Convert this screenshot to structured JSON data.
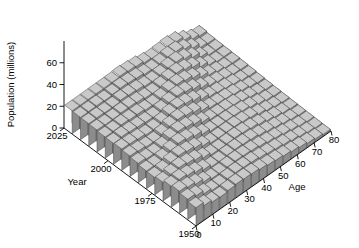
{
  "chart_data": {
    "type": "bar",
    "subtype": "bar3-surface",
    "title": "",
    "xlabel": "Age",
    "ylabel": "Year",
    "zlabel": "Population (millions)",
    "projection": "3d-isometric",
    "grid": false,
    "legend": "none",
    "zlim": [
      0,
      80
    ],
    "z_ticks": [
      "0",
      "20",
      "40",
      "60"
    ],
    "z_tick_values": [
      0,
      20,
      40,
      60
    ],
    "x_ticks": [
      "0",
      "10",
      "20",
      "30",
      "40",
      "50",
      "60",
      "70",
      "80"
    ],
    "x_tick_values": [
      0,
      10,
      20,
      30,
      40,
      50,
      60,
      70,
      80
    ],
    "y_ticks": [
      "2025",
      "2000",
      "1975",
      "1950"
    ],
    "y_tick_values": [
      2025,
      2000,
      1975,
      1950
    ],
    "x_label_text": "Age",
    "y_label_text": "Year",
    "z_label_text": "Population (millions)",
    "age_bins": [
      0,
      5,
      10,
      15,
      20,
      25,
      30,
      35,
      40,
      45,
      50,
      55,
      60,
      65,
      70,
      75,
      80
    ],
    "years": [
      1950,
      1955,
      1960,
      1965,
      1970,
      1975,
      1980,
      1985,
      1990,
      1995,
      2000,
      2005,
      2010,
      2015,
      2020,
      2025
    ],
    "series": [
      {
        "name": "1950",
        "values": [
          16.4,
          13.2,
          11.1,
          10.6,
          11.6,
          12.2,
          11.9,
          11.5,
          10.3,
          9.1,
          8.3,
          7.3,
          6.1,
          4.9,
          3.6,
          2.4,
          1.5
        ]
      },
      {
        "name": "1955",
        "values": [
          18.6,
          16.3,
          13.1,
          11.0,
          10.7,
          11.6,
          12.1,
          11.8,
          11.3,
          10.1,
          8.9,
          7.9,
          6.7,
          5.3,
          3.9,
          2.6,
          1.7
        ]
      },
      {
        "name": "1960",
        "values": [
          20.3,
          18.6,
          16.3,
          13.2,
          11.1,
          10.9,
          11.7,
          12.0,
          11.6,
          11.0,
          9.7,
          8.4,
          7.1,
          5.7,
          4.2,
          2.8,
          1.9
        ]
      },
      {
        "name": "1965",
        "values": [
          19.3,
          20.2,
          18.6,
          16.3,
          13.5,
          11.2,
          11.0,
          11.6,
          11.9,
          11.4,
          10.6,
          9.1,
          7.6,
          6.0,
          4.5,
          3.1,
          2.1
        ]
      },
      {
        "name": "1970",
        "values": [
          17.2,
          19.3,
          20.3,
          18.8,
          16.8,
          13.7,
          11.4,
          11.1,
          11.5,
          11.7,
          11.1,
          10.0,
          8.3,
          6.4,
          4.8,
          3.4,
          2.4
        ]
      },
      {
        "name": "1975",
        "values": [
          16.0,
          17.1,
          19.4,
          20.5,
          19.2,
          17.1,
          13.9,
          11.5,
          11.2,
          11.3,
          11.3,
          10.4,
          9.1,
          7.0,
          5.1,
          3.6,
          2.7
        ]
      },
      {
        "name": "1980",
        "values": [
          16.4,
          16.0,
          17.1,
          19.5,
          21.1,
          19.5,
          17.3,
          14.0,
          11.6,
          11.1,
          11.0,
          10.6,
          9.5,
          7.7,
          5.6,
          3.9,
          3.0
        ]
      },
      {
        "name": "1985",
        "values": [
          17.8,
          16.5,
          16.1,
          17.3,
          20.1,
          21.3,
          19.8,
          17.4,
          14.1,
          11.5,
          10.9,
          10.4,
          9.7,
          8.0,
          6.2,
          4.3,
          3.3
        ]
      },
      {
        "name": "1990",
        "values": [
          18.8,
          18.0,
          16.7,
          16.3,
          18.0,
          20.4,
          21.5,
          19.9,
          17.6,
          14.0,
          11.4,
          10.4,
          9.6,
          8.3,
          6.6,
          4.8,
          3.8
        ]
      },
      {
        "name": "1995",
        "values": [
          19.6,
          19.1,
          18.3,
          17.0,
          17.1,
          18.3,
          20.6,
          21.6,
          20.0,
          17.5,
          13.9,
          11.0,
          9.7,
          8.3,
          6.9,
          5.2,
          4.4
        ]
      },
      {
        "name": "2000",
        "values": [
          19.2,
          20.0,
          19.3,
          18.6,
          17.9,
          17.4,
          18.6,
          20.7,
          21.6,
          19.9,
          17.3,
          13.5,
          10.3,
          8.5,
          6.9,
          5.4,
          4.9
        ]
      },
      {
        "name": "2005",
        "values": [
          19.4,
          19.6,
          20.2,
          19.6,
          19.5,
          18.2,
          17.7,
          18.8,
          20.7,
          21.4,
          19.6,
          16.8,
          12.7,
          9.1,
          7.1,
          5.5,
          5.3
        ]
      },
      {
        "name": "2010",
        "values": [
          20.2,
          19.8,
          19.9,
          20.5,
          20.5,
          19.8,
          18.4,
          17.9,
          18.9,
          20.5,
          21.1,
          19.0,
          15.8,
          11.2,
          7.6,
          5.6,
          5.6
        ]
      },
      {
        "name": "2015",
        "values": [
          20.4,
          20.6,
          20.1,
          20.2,
          21.4,
          20.8,
          20.1,
          18.6,
          18.0,
          18.7,
          20.2,
          20.5,
          17.9,
          14.0,
          9.3,
          6.0,
          5.9
        ]
      },
      {
        "name": "2020",
        "values": [
          20.6,
          20.8,
          20.9,
          20.4,
          21.1,
          21.7,
          21.1,
          20.3,
          18.7,
          17.8,
          18.4,
          19.6,
          19.3,
          15.9,
          11.6,
          7.3,
          6.3
        ]
      },
      {
        "name": "2025",
        "values": [
          21.0,
          21.0,
          21.1,
          21.2,
          21.3,
          21.4,
          22.0,
          21.3,
          20.4,
          18.5,
          17.5,
          17.9,
          18.5,
          17.2,
          13.2,
          9.1,
          7.4
        ]
      }
    ],
    "colors": {
      "bar_top": "#c9c9c9",
      "bar_front": "#8c8c8c",
      "bar_side": "#e4e4e4",
      "edge": "#3a3a3a",
      "axis": "#000000",
      "background": "#ffffff"
    }
  }
}
